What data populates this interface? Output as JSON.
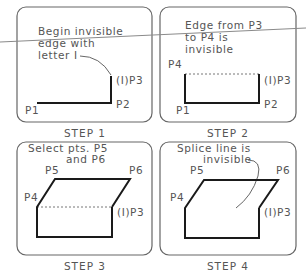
{
  "diagram": {
    "colors": {
      "frame": "#555555",
      "edge": "#1a1a1a",
      "invisible": "#777777",
      "overlay_line": "#8a8a8a"
    },
    "panels": [
      {
        "caption": "STEP 1",
        "note": [
          "Begin invisible",
          "edge with",
          "letter I"
        ],
        "points": {
          "p1": "P1",
          "p2": "P2",
          "p3": "(I)P3"
        }
      },
      {
        "caption": "STEP 2",
        "note": [
          "Edge from P3",
          "to P4 is",
          "invisible"
        ],
        "points": {
          "p1": "P1",
          "p2": "P2",
          "p3": "(I)P3",
          "p4": "P4"
        }
      },
      {
        "caption": "STEP 3",
        "note": [
          "Select pts. P5",
          "and P6"
        ],
        "points": {
          "p3": "(I)P3",
          "p4": "P4",
          "p5": "P5",
          "p6": "P6"
        }
      },
      {
        "caption": "STEP 4",
        "note": [
          "Splice line is",
          "invisible"
        ],
        "points": {
          "p3": "(I)P3",
          "p4": "P4",
          "p5": "P5",
          "p6": "P6"
        }
      }
    ]
  }
}
